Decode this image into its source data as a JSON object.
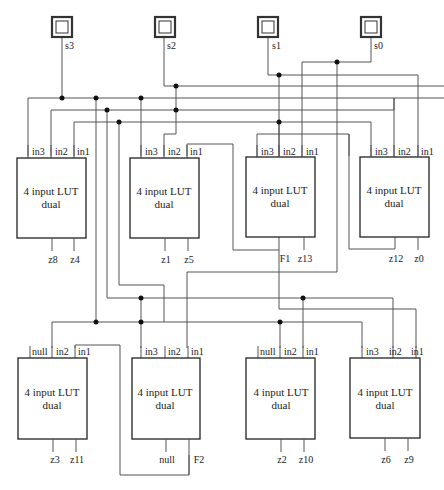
{
  "diagram": {
    "inputs": [
      {
        "name": "s3"
      },
      {
        "name": "s2"
      },
      {
        "name": "s1"
      },
      {
        "name": "s0"
      }
    ],
    "luts": [
      {
        "title": "4 input LUT",
        "subtitle": "dual",
        "pins_in": [
          "in3",
          "in2",
          "in1"
        ],
        "pins_out": [
          "z8",
          "z4"
        ]
      },
      {
        "title": "4 input LUT",
        "subtitle": "dual",
        "pins_in": [
          "in3",
          "in2",
          "in1"
        ],
        "pins_out": [
          "z1",
          "z5"
        ]
      },
      {
        "title": "4 input LUT",
        "subtitle": "dual",
        "pins_in": [
          "in3",
          "in2",
          "in1"
        ],
        "pins_out": [
          "F1",
          "z13"
        ]
      },
      {
        "title": "4 input LUT",
        "subtitle": "dual",
        "pins_in": [
          "in3",
          "in2",
          "in1"
        ],
        "pins_out": [
          "z12",
          "z0"
        ]
      },
      {
        "title": "4 input LUT",
        "subtitle": "dual",
        "pins_in": [
          "null",
          "in2",
          "in1"
        ],
        "pins_out": [
          "z3",
          "z11"
        ]
      },
      {
        "title": "4 input LUT",
        "subtitle": "dual",
        "pins_in": [
          "in3",
          "in2",
          "in1"
        ],
        "pins_out": [
          "null",
          "F2"
        ]
      },
      {
        "title": "4 input LUT",
        "subtitle": "dual",
        "pins_in": [
          "null",
          "in2",
          "in1"
        ],
        "pins_out": [
          "z2",
          "z10"
        ]
      },
      {
        "title": "4 input LUT",
        "subtitle": "dual",
        "pins_in": [
          "in3",
          "in2",
          "in1"
        ],
        "pins_out": [
          "z6",
          "z9"
        ]
      }
    ]
  }
}
